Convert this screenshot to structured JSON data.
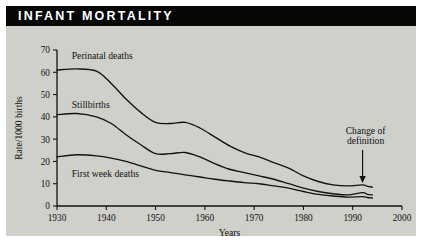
{
  "figure": {
    "title": "INFANT MORTALITY",
    "background_color": "#d0d0cb",
    "titlebar_color": "#070707",
    "title_color": "#ffffff",
    "ink_color": "#111111"
  },
  "chart_data": {
    "type": "line",
    "title": "INFANT MORTALITY",
    "xlabel": "Years",
    "ylabel": "Rate/1000 births",
    "xlim": [
      1930,
      2000
    ],
    "ylim": [
      0,
      70
    ],
    "xticks": [
      1930,
      1940,
      1950,
      1960,
      1970,
      1980,
      1990,
      2000
    ],
    "yticks": [
      0,
      10,
      20,
      30,
      40,
      50,
      60,
      70
    ],
    "grid": false,
    "legend": "inline-labels",
    "annotations": [
      {
        "text_line1": "Change of",
        "text_line2": "definition",
        "points_at_x": 1992,
        "points_at_y": 9
      }
    ],
    "series": [
      {
        "name": "Perinatal deaths",
        "label_x": 1933,
        "label_y": 66,
        "x": [
          1930,
          1934,
          1938,
          1941,
          1944,
          1947,
          1950,
          1953,
          1956,
          1959,
          1962,
          1965,
          1968,
          1971,
          1974,
          1977,
          1980,
          1983,
          1986,
          1989,
          1992,
          1993,
          1994
        ],
        "y": [
          61,
          61.5,
          60.5,
          55,
          48,
          42,
          37.5,
          37,
          37.5,
          35,
          31,
          27,
          24,
          22,
          19.5,
          17,
          13.5,
          11,
          9.5,
          9,
          9.5,
          8.8,
          8.5
        ]
      },
      {
        "name": "Stillbirths",
        "label_x": 1933,
        "label_y": 44,
        "x": [
          1930,
          1934,
          1938,
          1941,
          1944,
          1947,
          1950,
          1953,
          1956,
          1959,
          1962,
          1965,
          1968,
          1971,
          1974,
          1977,
          1980,
          1983,
          1986,
          1989,
          1992,
          1993,
          1994
        ],
        "y": [
          41,
          41.5,
          40,
          37,
          32,
          27.5,
          23.5,
          23.5,
          24,
          22,
          19,
          16.5,
          15,
          13.5,
          12,
          10,
          8,
          6.5,
          5.5,
          5,
          6,
          5.2,
          5
        ]
      },
      {
        "name": "First week deaths",
        "label_x": 1933,
        "label_y": 13,
        "x": [
          1930,
          1934,
          1938,
          1941,
          1944,
          1947,
          1950,
          1953,
          1956,
          1959,
          1962,
          1965,
          1968,
          1971,
          1974,
          1977,
          1980,
          1983,
          1986,
          1989,
          1992,
          1993,
          1994
        ],
        "y": [
          22,
          23,
          22.5,
          21.5,
          20,
          18,
          16,
          15,
          14,
          13,
          12,
          11.2,
          10.5,
          10,
          9,
          8,
          6.5,
          5.2,
          4.5,
          4,
          4.2,
          3.8,
          3.6
        ]
      }
    ]
  }
}
